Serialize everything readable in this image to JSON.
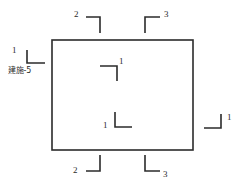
{
  "drawing": {
    "type": "architectural-floor-plan-outline",
    "background_color": "#ffffff",
    "line_color": "#2b2b2b",
    "outline": {
      "name": "building-outline-rectangle",
      "x": 52,
      "y": 40,
      "width": 141,
      "height": 110,
      "stroke_width": 1.6
    },
    "section_marks": [
      {
        "id": "mark-top-left",
        "label": "2",
        "position": "top-left-exterior",
        "orientation": "corner-open-down-left",
        "label_x": 74,
        "label_y": 10,
        "corner_x": 100,
        "corner_y": 17,
        "arm_h_length": 14,
        "arm_v_length": 16,
        "arm_h_dir": "left",
        "arm_v_dir": "down"
      },
      {
        "id": "mark-top-right",
        "label": "3",
        "position": "top-right-exterior",
        "orientation": "corner-open-down-right",
        "label_x": 164,
        "label_y": 10,
        "corner_x": 145,
        "corner_y": 17,
        "arm_h_length": 15,
        "arm_v_length": 16,
        "arm_h_dir": "right",
        "arm_v_dir": "down"
      },
      {
        "id": "mark-left",
        "label": "1",
        "position": "left-exterior",
        "orientation": "corner-open-up-right",
        "label_x": 12,
        "label_y": 46,
        "corner_x": 27,
        "corner_y": 63,
        "arm_h_length": 18,
        "arm_v_length": 13,
        "arm_h_dir": "right",
        "arm_v_dir": "up"
      },
      {
        "id": "mark-right",
        "label": "1",
        "position": "right-exterior",
        "orientation": "corner-open-up-left",
        "label_x": 227,
        "label_y": 113,
        "corner_x": 221,
        "corner_y": 128,
        "arm_h_length": 17,
        "arm_v_length": 14,
        "arm_h_dir": "left",
        "arm_v_dir": "up"
      },
      {
        "id": "mark-bottom-left",
        "label": "2",
        "position": "bottom-left-exterior",
        "orientation": "corner-open-up-right",
        "label_x": 73,
        "label_y": 166,
        "corner_x": 100,
        "corner_y": 171,
        "arm_h_length": 14,
        "arm_v_length": 16,
        "arm_h_dir": "left",
        "arm_v_dir": "up"
      },
      {
        "id": "mark-bottom-right",
        "label": "3",
        "position": "bottom-right-exterior",
        "orientation": "corner-open-up-right",
        "label_x": 163,
        "label_y": 170,
        "corner_x": 145,
        "corner_y": 171,
        "arm_h_length": 15,
        "arm_v_length": 16,
        "arm_h_dir": "right",
        "arm_v_dir": "up"
      },
      {
        "id": "mark-interior-upper",
        "label": "1",
        "position": "interior-upper",
        "orientation": "corner-open-down-left",
        "label_x": 119,
        "label_y": 57,
        "corner_x": 117,
        "corner_y": 66,
        "arm_h_length": 17,
        "arm_v_length": 15,
        "arm_h_dir": "left",
        "arm_v_dir": "down"
      },
      {
        "id": "mark-interior-lower",
        "label": "1",
        "position": "interior-lower",
        "orientation": "corner-open-up-right",
        "label_x": 103,
        "label_y": 121,
        "corner_x": 115,
        "corner_y": 127,
        "arm_h_length": 17,
        "arm_v_length": 15,
        "arm_h_dir": "right",
        "arm_v_dir": "up"
      }
    ],
    "sheet_reference": {
      "name": "sheet-reference-label",
      "text": "建施-5",
      "x": 8,
      "y": 67
    }
  }
}
